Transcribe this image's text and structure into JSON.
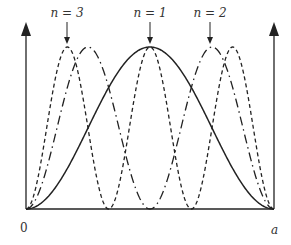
{
  "labels": {
    "n3": "n = 3",
    "n1": "n = 1",
    "n2": "n = 2",
    "origin": "0",
    "end": "a"
  },
  "colors": {
    "line": "#222222",
    "text": "#333333"
  },
  "curves": [
    {
      "n": 1,
      "style": "solid"
    },
    {
      "n": 2,
      "style": "dash-dot"
    },
    {
      "n": 3,
      "style": "dashed"
    }
  ]
}
